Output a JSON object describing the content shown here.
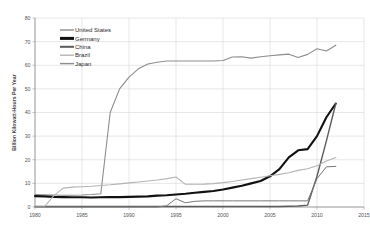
{
  "chart_data": {
    "type": "line",
    "title": "",
    "subtitle": "",
    "xlabel": "",
    "ylabel": "Billion Kilowatt-Hours Per Year",
    "xlim": [
      1980,
      2015
    ],
    "ylim": [
      0,
      80
    ],
    "xticks": [
      1980,
      1985,
      1990,
      1995,
      2000,
      2005,
      2010,
      2015
    ],
    "yticks": [
      0,
      10,
      20,
      30,
      40,
      50,
      60,
      70,
      80
    ],
    "grid": true,
    "legend_position": "upper-left",
    "legend_entries": [
      "United States",
      "Germany",
      "China",
      "Brazil",
      "Japan"
    ],
    "x": [
      1980,
      1981,
      1982,
      1983,
      1984,
      1985,
      1986,
      1987,
      1988,
      1989,
      1990,
      1991,
      1992,
      1993,
      1994,
      1995,
      1996,
      1997,
      1998,
      1999,
      2000,
      2001,
      2002,
      2003,
      2004,
      2005,
      2006,
      2007,
      2008,
      2009,
      2010,
      2011,
      2012
    ],
    "series": [
      {
        "name": "United States",
        "color": "#8d8d8d",
        "width": 1.1,
        "values": [
          5.3,
          5.2,
          5.1,
          5.0,
          5.0,
          5.1,
          5.3,
          5.6,
          40.0,
          50.0,
          55.0,
          58.5,
          60.5,
          61.3,
          61.8,
          61.8,
          61.8,
          61.8,
          61.8,
          61.8,
          62.0,
          63.5,
          63.6,
          63.0,
          63.6,
          64.0,
          64.4,
          64.7,
          63.3,
          64.6,
          67.0,
          66.0,
          68.5
        ]
      },
      {
        "name": "Germany",
        "color": "#111111",
        "width": 2.1,
        "values": [
          4.6,
          4.5,
          4.3,
          4.2,
          4.1,
          4.1,
          4.0,
          4.1,
          4.2,
          4.2,
          4.3,
          4.4,
          4.5,
          4.8,
          5.0,
          5.3,
          5.6,
          6.0,
          6.4,
          6.8,
          7.4,
          8.2,
          9.0,
          10.0,
          11.0,
          13.0,
          16.0,
          21.0,
          24.0,
          24.5,
          30.0,
          38.0,
          43.8
        ]
      },
      {
        "name": "China",
        "color": "#5b5b5b",
        "width": 1.4,
        "values": [
          0.2,
          0.2,
          0.2,
          0.2,
          0.2,
          0.2,
          0.2,
          0.2,
          0.2,
          0.2,
          0.2,
          0.2,
          0.2,
          0.2,
          0.2,
          0.2,
          0.2,
          0.2,
          0.2,
          0.2,
          0.2,
          0.2,
          0.2,
          0.2,
          0.2,
          0.2,
          0.2,
          0.3,
          0.4,
          0.8,
          13.0,
          28.0,
          43.8
        ]
      },
      {
        "name": "Brazil",
        "color": "#b4b4b4",
        "width": 1.1,
        "values": [
          0.1,
          0.1,
          4.8,
          8.0,
          8.4,
          8.6,
          8.8,
          9.1,
          9.4,
          9.8,
          10.2,
          10.6,
          11.0,
          11.4,
          12.0,
          12.7,
          9.6,
          9.6,
          9.7,
          9.9,
          10.3,
          10.8,
          11.4,
          12.0,
          12.6,
          13.2,
          13.8,
          14.5,
          15.5,
          16.2,
          17.5,
          19.5,
          21.0
        ]
      },
      {
        "name": "Japan",
        "color": "#777777",
        "width": 1.0,
        "values": [
          0.0,
          0.0,
          0.0,
          0.0,
          0.0,
          0.0,
          0.0,
          0.0,
          0.0,
          0.0,
          0.0,
          0.0,
          0.0,
          0.0,
          0.5,
          3.5,
          1.8,
          2.4,
          2.6,
          2.6,
          2.6,
          2.6,
          2.6,
          2.6,
          2.6,
          2.6,
          2.6,
          2.6,
          2.6,
          2.6,
          12.0,
          17.0,
          17.2
        ]
      }
    ]
  },
  "legend": {
    "items": [
      {
        "label": "United States",
        "swatch": "#8d8d8d",
        "thickness": 1.4
      },
      {
        "label": "Germany",
        "swatch": "#111111",
        "thickness": 3.0
      },
      {
        "label": "China",
        "swatch": "#5b5b5b",
        "thickness": 2.0
      },
      {
        "label": "Brazil",
        "swatch": "#b4b4b4",
        "thickness": 1.4
      },
      {
        "label": "Japan",
        "swatch": "#8d8d8d",
        "thickness": 1.4
      }
    ]
  },
  "axes": {
    "y_title": "Billion Kilowatt-Hours Per Year",
    "y_labels": [
      "80",
      "70",
      "60",
      "50",
      "40",
      "30",
      "20",
      "10",
      "0"
    ],
    "x_labels": [
      "1980",
      "1985",
      "1990",
      "1995",
      "2000",
      "2005",
      "2010",
      "2015"
    ]
  }
}
